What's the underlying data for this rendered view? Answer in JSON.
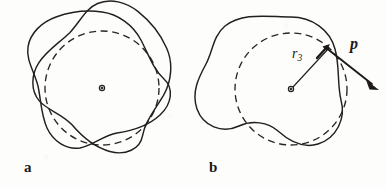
{
  "figure": {
    "width": 387,
    "height": 187,
    "background_color": "#fdfdfc",
    "ink_color": "#231f1d"
  },
  "panels": [
    {
      "id": "a",
      "label": "a",
      "label_style": "bold-serif",
      "center": {
        "x": 102,
        "y": 88
      },
      "center_marker": "open-dot",
      "reference_circle": {
        "style": "dashed",
        "radius": 57,
        "color": "#2a2624"
      },
      "shapes": [
        {
          "name": "trefoil-curve-1",
          "style": "solid",
          "lobes": 3,
          "mean_radius": 60,
          "amplitude": 16,
          "phase_deg": 90
        },
        {
          "name": "trefoil-curve-2",
          "style": "solid",
          "lobes": 3,
          "mean_radius": 60,
          "amplitude": 16,
          "phase_deg": 150
        }
      ],
      "annotations": []
    },
    {
      "id": "b",
      "label": "b",
      "label_style": "bold-serif",
      "center": {
        "x": 291,
        "y": 89
      },
      "center_marker": "open-dot",
      "reference_circle": {
        "style": "dashed",
        "radius": 56,
        "color": "#2a2624"
      },
      "shapes": [
        {
          "name": "trefoil-curve-1",
          "style": "solid",
          "lobes": 3,
          "mean_radius": 59,
          "amplitude": 20,
          "phase_deg": 90
        }
      ],
      "annotations": [
        {
          "name": "radius-label",
          "text": "r",
          "subscript": "3",
          "kind": "radius-vector-label",
          "leader_from": {
            "x": 291,
            "y": 89
          },
          "leader_to": {
            "x": 327,
            "y": 50
          },
          "label_pos": {
            "x": 292,
            "y": 47
          }
        },
        {
          "name": "momentum-vector-label",
          "text": "p",
          "kind": "vector-label",
          "style": "bold-italic",
          "vector_from": {
            "x": 326,
            "y": 48
          },
          "vector_to": {
            "x": 378,
            "y": 89
          },
          "label_pos": {
            "x": 350,
            "y": 36
          }
        },
        {
          "name": "surface-normal-tick",
          "kind": "short-arrow",
          "from": {
            "x": 318,
            "y": 56
          },
          "to": {
            "x": 329,
            "y": 46
          }
        }
      ]
    }
  ],
  "symbols": {
    "r_symbol": "r",
    "r_subscript": "3",
    "p_symbol": "p",
    "panel_a_letter": "a",
    "panel_b_letter": "b"
  }
}
